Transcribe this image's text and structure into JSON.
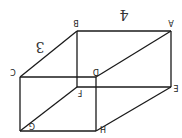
{
  "diagram": {
    "type": "rectangular-prism",
    "orientation": "rotated 180 degrees",
    "vertices": [
      {
        "label": "A",
        "x": 171,
        "y": 31,
        "lx": 171,
        "ly": 22
      },
      {
        "label": "B",
        "x": 77,
        "y": 31,
        "lx": 76,
        "ly": 22
      },
      {
        "label": "C",
        "x": 20,
        "y": 77,
        "lx": 13,
        "ly": 71
      },
      {
        "label": "D",
        "x": 96,
        "y": 77,
        "lx": 96,
        "ly": 71
      },
      {
        "label": "E",
        "x": 171,
        "y": 87,
        "lx": 176,
        "ly": 87
      },
      {
        "label": "F",
        "x": 77,
        "y": 87,
        "lx": 80,
        "ly": 92
      },
      {
        "label": "G",
        "x": 20,
        "y": 131,
        "lx": 32,
        "ly": 125
      },
      {
        "label": "H",
        "x": 96,
        "y": 131,
        "lx": 103,
        "ly": 128
      }
    ],
    "edges": [
      [
        "A",
        "B"
      ],
      [
        "B",
        "C"
      ],
      [
        "A",
        "D"
      ],
      [
        "C",
        "D"
      ],
      [
        "B",
        "F"
      ],
      [
        "A",
        "E"
      ],
      [
        "C",
        "G"
      ],
      [
        "D",
        "H"
      ],
      [
        "F",
        "E"
      ],
      [
        "G",
        "H"
      ],
      [
        "F",
        "G"
      ],
      [
        "E",
        "H"
      ]
    ],
    "measurements": [
      {
        "label": "4",
        "edge": "A-B",
        "x": 124,
        "y": 14
      },
      {
        "label": "3",
        "edge": "B-C",
        "x": 40,
        "y": 46
      }
    ]
  }
}
